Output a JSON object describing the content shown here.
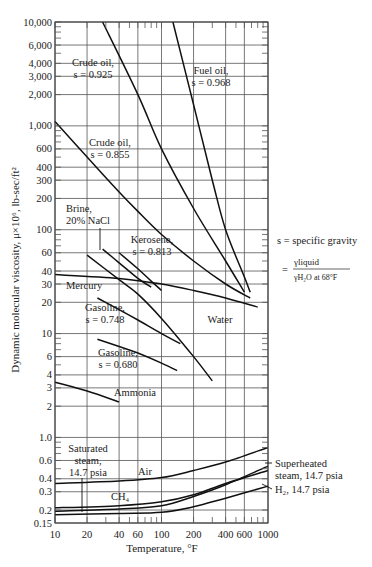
{
  "chart_data": {
    "type": "line",
    "title": "",
    "xlabel": "Temperature, °F",
    "ylabel": "Dynamic molecular viscosity, μ×10⁶, lb-sec/ft²",
    "xscale": "log",
    "yscale": "log",
    "xlim": [
      10,
      1000
    ],
    "ylim": [
      0.15,
      10000
    ],
    "grid": true,
    "x_ticks": [
      "10",
      "20",
      "40",
      "60",
      "100",
      "200",
      "400",
      "600",
      "1000"
    ],
    "x_tick_values": [
      10,
      20,
      40,
      60,
      100,
      200,
      400,
      600,
      1000
    ],
    "y_ticks": [
      "10,000",
      "6,000",
      "4,000",
      "3,000",
      "2,000",
      "1,000",
      "600",
      "400",
      "300",
      "200",
      "100",
      "60",
      "40",
      "30",
      "20",
      "10",
      "6",
      "4",
      "3",
      "2",
      "1.0",
      "0.6",
      "0.4",
      "0.3",
      "0.2",
      "0.15"
    ],
    "y_tick_values": [
      10000,
      6000,
      4000,
      3000,
      2000,
      1000,
      600,
      400,
      300,
      200,
      100,
      60,
      40,
      30,
      20,
      10,
      6,
      4,
      3,
      2,
      1.0,
      0.6,
      0.4,
      0.3,
      0.2,
      0.15
    ],
    "annotation": {
      "line1": "s = specific gravity",
      "line2_prefix": "=",
      "numerator": "γliquid",
      "denominator": "γH₂O at 68°F"
    },
    "series": [
      {
        "name": "Crude oil, s = 0.925",
        "label_lines": [
          "Crude oil,",
          "s = 0.925"
        ],
        "x": [
          28,
          60,
          100,
          200,
          400,
          600
        ],
        "y": [
          10000,
          2000,
          600,
          160,
          50,
          25
        ]
      },
      {
        "name": "Fuel oil, s = 0.968",
        "label_lines": [
          "Fuel oil,",
          "s = 0.968"
        ],
        "x": [
          128,
          200,
          300,
          400,
          600,
          680
        ],
        "y": [
          10000,
          1600,
          300,
          100,
          35,
          25
        ]
      },
      {
        "name": "Crude oil, s = 0.855",
        "label_lines": [
          "Crude oil,",
          "s = 0.855"
        ],
        "x": [
          10,
          20,
          40,
          60,
          100,
          200,
          400,
          680
        ],
        "y": [
          1100,
          500,
          230,
          150,
          90,
          50,
          30,
          22
        ]
      },
      {
        "name": "Brine, 20% NaCl",
        "label_lines": [
          "Brine,",
          "20% NaCl"
        ],
        "x": [
          28,
          40,
          60,
          80
        ],
        "y": [
          65,
          48,
          34,
          28
        ]
      },
      {
        "name": "Kerosene, s = 0.813",
        "label_lines": [
          "Kerosene,",
          "s = 0.813"
        ],
        "x": [
          40,
          60,
          80,
          100
        ],
        "y": [
          60,
          42,
          32,
          26
        ]
      },
      {
        "name": "Mercury",
        "label_lines": [
          "Mercury"
        ],
        "x": [
          10,
          40,
          100,
          200,
          400,
          800
        ],
        "y": [
          37,
          34,
          30,
          26,
          22,
          18
        ]
      },
      {
        "name": "Water",
        "label_lines": [
          "Water"
        ],
        "x": [
          20,
          40,
          60,
          100,
          200,
          300
        ],
        "y": [
          57,
          33,
          24,
          14,
          6,
          3.5
        ]
      },
      {
        "name": "Gasoline, s = 0.748",
        "label_lines": [
          "Gasoline,",
          "s = 0.748"
        ],
        "x": [
          25,
          40,
          60,
          100,
          150
        ],
        "y": [
          22,
          17,
          13.5,
          10,
          8
        ]
      },
      {
        "name": "Gasoline, s = 0.680",
        "label_lines": [
          "Gasoline,",
          "s = 0.680"
        ],
        "x": [
          25,
          40,
          60,
          100,
          140
        ],
        "y": [
          8.8,
          7.5,
          6.5,
          5.2,
          4.4
        ]
      },
      {
        "name": "Ammonia",
        "label_lines": [
          "Ammonia"
        ],
        "x": [
          10,
          20,
          40
        ],
        "y": [
          3.4,
          2.8,
          2.2
        ]
      },
      {
        "name": "Air",
        "label_lines": [
          "Air"
        ],
        "x": [
          10,
          40,
          100,
          200,
          400,
          1000
        ],
        "y": [
          0.36,
          0.38,
          0.41,
          0.48,
          0.58,
          0.8
        ]
      },
      {
        "name": "CH4",
        "label_lines": [
          "CH₄"
        ],
        "x": [
          10,
          40,
          100,
          200,
          400,
          1000
        ],
        "y": [
          0.21,
          0.22,
          0.24,
          0.28,
          0.36,
          0.48
        ]
      },
      {
        "name": "Superheated steam, 14.7 psia",
        "label_lines": [
          "Superheated",
          "steam, 14.7 psia"
        ],
        "x": [
          10,
          40,
          100,
          200,
          400,
          1000
        ],
        "y": [
          0.195,
          0.205,
          0.22,
          0.27,
          0.35,
          0.53
        ]
      },
      {
        "name": "H2, 14.7 psia",
        "label_lines": [
          "H₂, 14.7 psia"
        ],
        "x": [
          10,
          40,
          100,
          200,
          400,
          1000
        ],
        "y": [
          0.18,
          0.185,
          0.19,
          0.215,
          0.26,
          0.34
        ]
      },
      {
        "name": "Saturated steam, 14.7 psia",
        "label_lines": [
          "Saturated",
          "steam,",
          "14.7 psia"
        ],
        "x": [
          18
        ],
        "y": [
          0.2
        ]
      }
    ]
  }
}
